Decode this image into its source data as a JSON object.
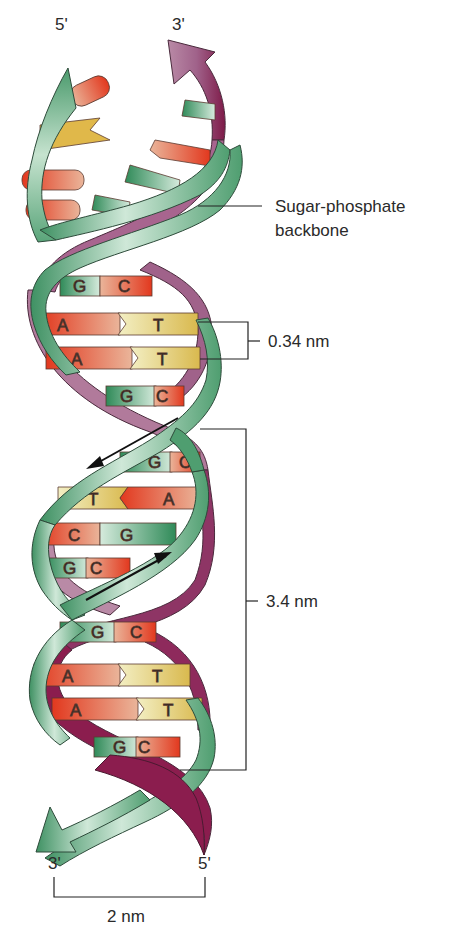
{
  "diagram": {
    "colors": {
      "green_strand": "#5faa7c",
      "green_strand_light": "#cfe8d8",
      "purple_strand": "#a35a86",
      "purple_strand_dark": "#8b1d4e",
      "adenine": "#e8542c",
      "thymine": "#e6c84a",
      "guanine": "#3f9a66",
      "cytosine": "#e04a2a",
      "outline": "#2d3b33"
    },
    "strand_ends": {
      "top_left": "5'",
      "top_right": "3'",
      "bottom_left": "3'",
      "bottom_right": "5'"
    },
    "labels": {
      "backbone": [
        "Sugar-phosphate",
        "backbone"
      ],
      "base_pair_spacing": "0.34 nm",
      "helix_turn": "3.4 nm",
      "helix_width": "2 nm"
    },
    "base_pairs": [
      {
        "left": "G",
        "right": "C"
      },
      {
        "left": "A",
        "right": "T"
      },
      {
        "left": "A",
        "right": "T"
      },
      {
        "left": "G",
        "right": "C"
      },
      {
        "left": "G",
        "right": "C"
      },
      {
        "left": "T",
        "right": "A"
      },
      {
        "left": "C",
        "right": "G"
      },
      {
        "left": "G",
        "right": "C"
      },
      {
        "left": "G",
        "right": "C"
      },
      {
        "left": "A",
        "right": "T"
      },
      {
        "left": "A",
        "right": "T"
      },
      {
        "left": "G",
        "right": "C"
      }
    ]
  }
}
